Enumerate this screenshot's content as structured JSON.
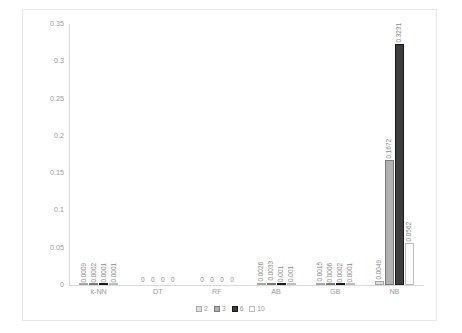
{
  "chart_data": {
    "type": "bar",
    "title": "",
    "xlabel": "",
    "ylabel": "",
    "ylim": [
      0,
      0.35
    ],
    "yticks": [
      "0",
      "0.05",
      "0.1",
      "0.15",
      "0.2",
      "0.25",
      "0.3",
      "0.35"
    ],
    "ytick_values": [
      0,
      0.05,
      0.1,
      0.15,
      0.2,
      0.25,
      0.3,
      0.35
    ],
    "grid": false,
    "legend_position": "bottom",
    "categories": [
      "k-NN",
      "DT",
      "RF",
      "AB",
      "GB",
      "NB"
    ],
    "series": [
      {
        "name": "2",
        "values": [
          0.0009,
          0,
          0,
          0.0026,
          0.0015,
          0.0049
        ],
        "labels": [
          "0.0009",
          "0",
          "0",
          "0.0026",
          "0.0015",
          "0.0049"
        ]
      },
      {
        "name": "3",
        "values": [
          0.0002,
          0,
          0,
          0.0033,
          0.0006,
          0.1672
        ],
        "labels": [
          "0.0002",
          "0",
          "0",
          "0.0033",
          "0.0006",
          "0.1672"
        ]
      },
      {
        "name": "6",
        "values": [
          0.0001,
          0,
          0,
          0.001,
          0.0002,
          0.3231
        ],
        "labels": [
          "0.0001",
          "0",
          "0",
          "0.001",
          "0.0002",
          "0.3231"
        ]
      },
      {
        "name": "10",
        "values": [
          0.0001,
          0,
          0,
          0.001,
          0.0001,
          0.0562
        ],
        "labels": [
          "0.0001",
          "0",
          "0",
          "0.001",
          "0.0001",
          "0.0562"
        ]
      }
    ],
    "colors": {
      "series_2": "#dedede",
      "series_3": "#b0b0b0",
      "series_6": "#3d3d3d",
      "series_10": "#fbfbfb",
      "axis_text": "#9a9a9a",
      "border": "#e8e8e8"
    }
  }
}
